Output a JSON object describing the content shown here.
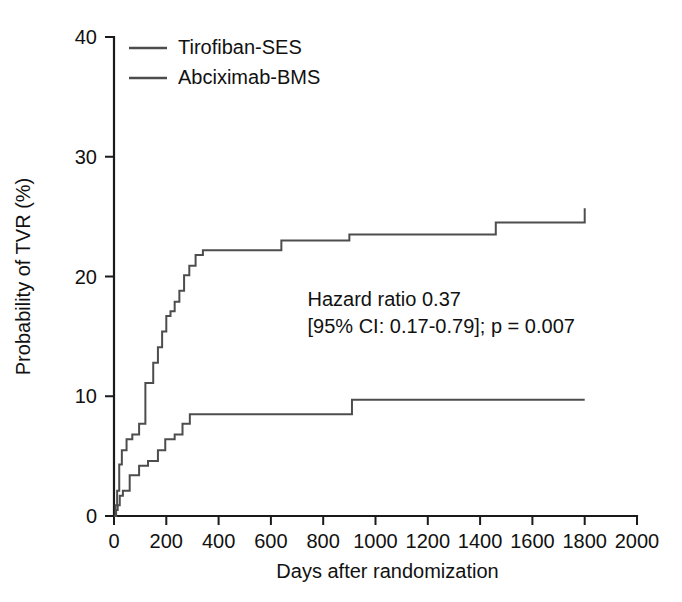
{
  "chart_data": {
    "type": "line",
    "subtype": "kaplan-meier-step",
    "title": "",
    "xlabel": "Days after randomization",
    "ylabel": "Probability of TVR (%)",
    "xlim": [
      0,
      2000
    ],
    "ylim": [
      0,
      40
    ],
    "xticks": [
      0,
      200,
      400,
      600,
      800,
      1000,
      1200,
      1400,
      1600,
      1800,
      2000
    ],
    "yticks": [
      0,
      10,
      20,
      30,
      40
    ],
    "xtick_labels": [
      "0",
      "200",
      "400",
      "600",
      "800",
      "1000",
      "1200",
      "1400",
      "1600",
      "1800",
      "2000"
    ],
    "ytick_labels": [
      "0",
      "10",
      "20",
      "30",
      "40"
    ],
    "grid": false,
    "legend_position": "top-left-inside",
    "series": [
      {
        "name": "Tirofiban-SES",
        "color": "#4d4d4d",
        "step_type": "post",
        "x": [
          0,
          8,
          14,
          22,
          34,
          60,
          96,
          130,
          168,
          196,
          232,
          262,
          290,
          910,
          1800
        ],
        "y": [
          0.0,
          0.5,
          0.9,
          1.7,
          2.1,
          3.4,
          4.2,
          4.6,
          5.5,
          6.4,
          6.8,
          7.7,
          8.5,
          9.7,
          9.7
        ]
      },
      {
        "name": "Abciximab-BMS",
        "color": "#4d4d4d",
        "step_type": "post",
        "x": [
          0,
          6,
          12,
          20,
          30,
          48,
          70,
          96,
          120,
          150,
          168,
          184,
          200,
          216,
          232,
          250,
          268,
          288,
          312,
          340,
          368,
          640,
          900,
          1460,
          1800
        ],
        "y": [
          0.0,
          0.9,
          2.1,
          4.3,
          5.5,
          6.4,
          6.8,
          7.7,
          11.1,
          12.8,
          14.1,
          15.4,
          16.7,
          17.1,
          17.9,
          18.8,
          20.1,
          20.9,
          21.8,
          22.2,
          22.2,
          23.0,
          23.5,
          24.5,
          25.7
        ]
      }
    ],
    "annotations": [
      {
        "name": "hazard-ratio-annotation",
        "lines": [
          "Hazard ratio 0.37",
          "[95% CI: 0.17-0.79]; p = 0.007"
        ],
        "x": 740,
        "y": 17.5
      }
    ]
  },
  "legend": {
    "items": [
      {
        "label": "Tirofiban-SES",
        "color": "#4d4d4d"
      },
      {
        "label": "Abciximab-BMS",
        "color": "#4d4d4d"
      }
    ]
  },
  "axes": {
    "x_title": "Days after randomization",
    "y_title": "Probability of TVR (%)"
  },
  "colors": {
    "axis": "#1a1a1a",
    "curve": "#4d4d4d",
    "background": "#ffffff",
    "text": "#111111"
  }
}
